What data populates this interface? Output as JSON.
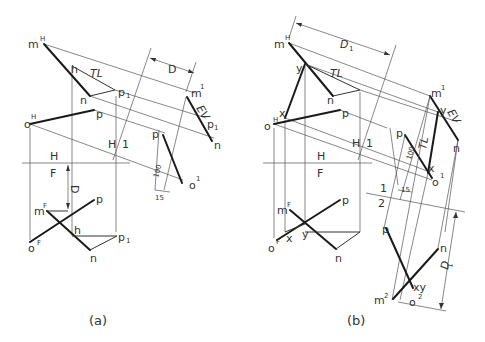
{
  "figure_a": {
    "caption": "(a)",
    "top_view": {
      "labels": {
        "m": "m",
        "m_sup": "H",
        "h": "h",
        "TL": "TL",
        "n": "n",
        "p1": "p",
        "p1_sub": "1",
        "o": "o",
        "o_sup": "H",
        "p": "p"
      }
    },
    "fold_HF": {
      "upper": "H",
      "lower": "F"
    },
    "fold_H1": {
      "left": "H",
      "right": "1"
    },
    "aux_view": {
      "labels": {
        "m": "m",
        "m_sup": "1",
        "EV": "EV",
        "p1": "p",
        "p1_sub": "1",
        "n": "n",
        "p": "p",
        "o": "o",
        "o_sup": "1"
      },
      "dimensions": {
        "clearance": "100",
        "width": "15",
        "distance": "D"
      }
    },
    "front_view": {
      "labels": {
        "m": "m",
        "m_sup": "F",
        "p": "p",
        "h": "h",
        "p1": "p",
        "p1_sub": "1",
        "o": "o",
        "o_sup": "F",
        "n": "n"
      },
      "dimension_D": "D"
    }
  },
  "figure_b": {
    "caption": "(b)",
    "top_view": {
      "labels": {
        "m": "m",
        "m_sup": "H",
        "y": "y",
        "TL": "TL",
        "n": "n",
        "o": "o",
        "o_sup": "H",
        "x": "x",
        "p": "p"
      },
      "dimension": "D",
      "dimension_sub": "1"
    },
    "fold_HF": {
      "upper": "H",
      "lower": "F"
    },
    "fold_H1": {
      "left": "H",
      "right": "1"
    },
    "aux_view_1": {
      "labels": {
        "m": "m",
        "m_sup": "1",
        "y": "y",
        "EV": "EV",
        "n": "n",
        "p": "p",
        "TL": "TL",
        "x": "x",
        "o": "o",
        "o_sup": "1"
      },
      "dimensions": {
        "clearance": "100",
        "width": "15"
      }
    },
    "fold_12": {
      "upper": "1",
      "lower": "2"
    },
    "aux_view_2": {
      "labels": {
        "p": "p",
        "n": "n",
        "xy": "xy",
        "m": "m",
        "m_sup": "2",
        "o": "o",
        "o_sup": "2"
      },
      "dimension": "D",
      "dimension_sub": "1"
    },
    "front_view": {
      "labels": {
        "m": "m",
        "m_sup": "F",
        "p": "p",
        "x": "x",
        "y": "y",
        "o": "o",
        "o_sup": "F",
        "n": "n"
      }
    }
  }
}
